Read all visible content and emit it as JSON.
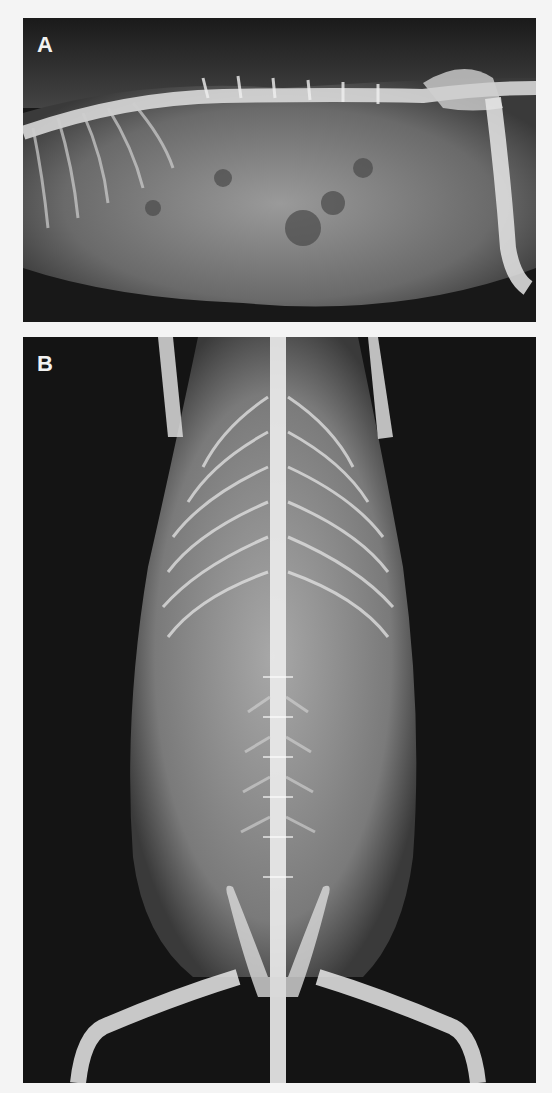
{
  "figure": {
    "panels": [
      {
        "label": "A",
        "view": "lateral radiograph",
        "subject": "abdomen and thorax with spine, ribs and hind limb"
      },
      {
        "label": "B",
        "view": "ventrodorsal radiograph",
        "subject": "whole body with spine, ribcage, pelvis and hind limbs"
      }
    ],
    "colors": {
      "background": "#f4f4f4",
      "film_dark": "#141414",
      "bone": "#e8e8e8",
      "soft_tissue": "#8a8a8a"
    }
  }
}
